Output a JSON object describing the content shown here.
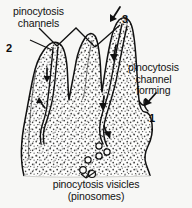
{
  "figure": {
    "kind": "biology-diagram",
    "background_color": "#f7f7f5",
    "ink_color": "#111111",
    "cytoplasm_fill": "stipple"
  },
  "labels": {
    "channels": {
      "line1": "pinocytosis",
      "line2": "channels"
    },
    "forming": {
      "line1": "pinocytosis",
      "line2": "channel",
      "line3": "forming"
    },
    "vesicles": {
      "line1": "pinocytosis visicles",
      "line2": "(pinosomes)"
    }
  },
  "callouts": {
    "one": "1",
    "two": "2",
    "three": "3"
  },
  "icons": {
    "arrow_down_channel_a": "arrow-down-icon",
    "arrow_down_channel_b": "arrow-down-icon",
    "arrow_down_channel_c": "arrow-down-icon",
    "arrow_down_channel_d": "arrow-down-icon",
    "arrow_pointer_3": "arrow-pointer-icon",
    "arrow_pointer_1": "arrow-pointer-icon",
    "leader_line_channels_left": "leader-line-icon",
    "leader_line_channels_right": "leader-line-icon",
    "leader_line_vesicles": "leader-line-icon"
  },
  "vesicles": {
    "count": 6,
    "positions": [
      {
        "cx": 99,
        "cy": 146,
        "r": 3.1
      },
      {
        "cx": 107,
        "cy": 152,
        "r": 3.1
      },
      {
        "cx": 99,
        "cy": 156,
        "r": 3.1
      },
      {
        "cx": 88,
        "cy": 160,
        "r": 3.1
      },
      {
        "cx": 83,
        "cy": 170,
        "r": 3.3
      },
      {
        "cx": 92,
        "cy": 174,
        "r": 3.5
      }
    ]
  }
}
